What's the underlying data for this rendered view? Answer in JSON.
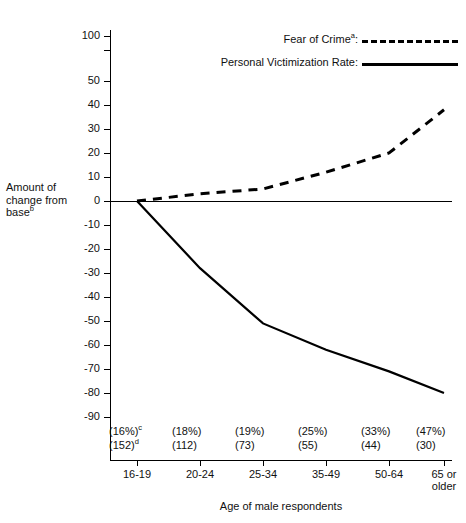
{
  "runhead": "",
  "axis": {
    "y_title_line1": "Amount of",
    "y_title_line2": "change from",
    "y_title_line3": "base",
    "y_title_sup": "b",
    "x_title": "Age of male respondents",
    "y_ticks": [
      "100",
      "50",
      "40",
      "30",
      "20",
      "10",
      "0",
      "-10",
      "-20",
      "-30",
      "-40",
      "-50",
      "-60",
      "-70",
      "-80",
      "-90"
    ]
  },
  "legend": {
    "items": [
      {
        "label": "Fear of Crime",
        "sup": "a",
        "suffix": ":",
        "style": "dashed"
      },
      {
        "label": "Personal Victimization Rate",
        "sup": "",
        "suffix": ":",
        "style": "solid"
      }
    ]
  },
  "annotations": {
    "percent_sup": "c",
    "count_sup": "d"
  },
  "chart_data": {
    "type": "line",
    "title": "",
    "xlabel": "Age of male respondents",
    "ylabel": "Amount of change from base",
    "ylim": [
      -90,
      100
    ],
    "y_axis_break": {
      "between": [
        50,
        100
      ],
      "note": "scale break above 50"
    },
    "y_ticks": [
      100,
      50,
      40,
      30,
      20,
      10,
      0,
      -10,
      -20,
      -30,
      -40,
      -50,
      -60,
      -70,
      -80,
      -90
    ],
    "grid": false,
    "legend_position": "top-right",
    "categories": [
      "16-19",
      "20-24",
      "25-34",
      "35-49",
      "50-64",
      "65 or older"
    ],
    "category_percent_labels": [
      "(16%)",
      "(18%)",
      "(19%)",
      "(25%)",
      "(33%)",
      "(47%)"
    ],
    "category_count_labels": [
      "(152)",
      "(112)",
      "(73)",
      "(55)",
      "(44)",
      "(30)"
    ],
    "series": [
      {
        "name": "Fear of Crime",
        "style": "dashed",
        "values": [
          0,
          3,
          5,
          12,
          20,
          38
        ]
      },
      {
        "name": "Personal Victimization Rate",
        "style": "solid",
        "values": [
          0,
          -28,
          -51,
          -62,
          -71,
          -80
        ]
      }
    ]
  }
}
